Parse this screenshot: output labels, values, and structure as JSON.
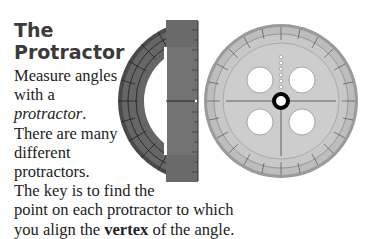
{
  "heading": {
    "line1": "The",
    "line2": "Protractor"
  },
  "paragraph": {
    "l1": "Measure angles",
    "l2": "with a",
    "l3_italic": "protractor",
    "l3_end": ".",
    "l4": "There are many",
    "l5": "different",
    "l6": "protractors.",
    "l7": "The key is to find the",
    "l8": "point on each protractor to which",
    "l9_start": "you align the ",
    "l9_bold": "vertex",
    "l9_end": " of the angle."
  },
  "images": {
    "half_protractor": "half-protractor-dark-gray",
    "full_protractor": "full-circle-protractor-light-gray"
  },
  "colors": {
    "dark_protractor": "#5c5c5c",
    "light_protractor": "#c8c8c8",
    "title": "#3a3a3a"
  }
}
